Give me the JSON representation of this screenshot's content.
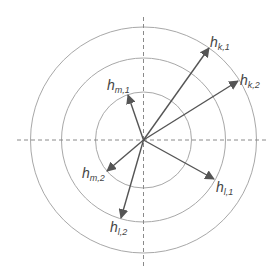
{
  "diagram": {
    "center": [
      143.5,
      140
    ],
    "circles": [
      48,
      82,
      113
    ],
    "axes": {
      "h": [
        17,
        268
      ],
      "v": [
        17,
        268
      ]
    },
    "colors": {
      "circle": "#a8a8a8",
      "axis": "#8a8a8a",
      "vector": "#555555",
      "label": "#444444"
    },
    "vectors": [
      {
        "id": "hk1",
        "tip": [
          209,
          48
        ],
        "label_main": "h",
        "label_sub": "k,1",
        "lx": 210,
        "ly": 47
      },
      {
        "id": "hk2",
        "tip": [
          238,
          81
        ],
        "label_main": "h",
        "label_sub": "k,2",
        "lx": 240,
        "ly": 85
      },
      {
        "id": "hm1",
        "tip": [
          128,
          95
        ],
        "label_main": "h",
        "label_sub": "m,1",
        "lx": 107,
        "ly": 90
      },
      {
        "id": "hm2",
        "tip": [
          107,
          171
        ],
        "label_main": "h",
        "label_sub": "m,2",
        "lx": 82,
        "ly": 178
      },
      {
        "id": "hl1",
        "tip": [
          214,
          179
        ],
        "label_main": "h",
        "label_sub": "l,1",
        "lx": 216,
        "ly": 192
      },
      {
        "id": "hl2",
        "tip": [
          121,
          218
        ],
        "label_main": "h",
        "label_sub": "l,2",
        "lx": 110,
        "ly": 232
      }
    ]
  }
}
